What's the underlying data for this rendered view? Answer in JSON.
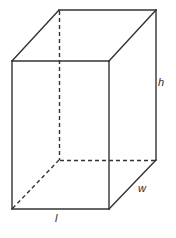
{
  "figure": {
    "shape": "rectangular prism",
    "background_color": "#ffffff",
    "stroke_color": "#333333",
    "hidden_edge_color": "#333333",
    "label_color": "#2b2b2b",
    "stroke_width": 1.4,
    "dash_pattern": "4,3"
  },
  "labels": {
    "height": "h",
    "width": "w",
    "length": "l"
  },
  "geometry": {
    "front_face": {
      "top_left": [
        12,
        61
      ],
      "top_right": [
        109,
        61
      ],
      "bottom_right": [
        109,
        209
      ],
      "bottom_left": [
        12,
        209
      ]
    },
    "back_face": {
      "top_left": [
        59,
        10
      ],
      "top_right": [
        156,
        10
      ],
      "bottom_right": [
        156,
        160
      ],
      "bottom_left": [
        59,
        160
      ]
    },
    "hidden_edges": [
      "back-top-left to back-bottom-left",
      "back-bottom-left to back-bottom-right",
      "back-bottom-left to front-bottom-left"
    ]
  }
}
